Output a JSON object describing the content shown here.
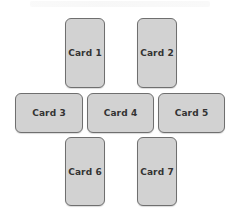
{
  "diagram": {
    "cards": [
      {
        "label": "Card 1",
        "x": 65,
        "y": 18,
        "w": 40,
        "h": 70
      },
      {
        "label": "Card 2",
        "x": 137,
        "y": 18,
        "w": 40,
        "h": 70
      },
      {
        "label": "Card 3",
        "x": 15,
        "y": 93,
        "w": 68,
        "h": 40
      },
      {
        "label": "Card 4",
        "x": 87,
        "y": 93,
        "w": 67,
        "h": 40
      },
      {
        "label": "Card 5",
        "x": 158,
        "y": 93,
        "w": 67,
        "h": 40
      },
      {
        "label": "Card 6",
        "x": 65,
        "y": 137,
        "w": 40,
        "h": 69
      },
      {
        "label": "Card 7",
        "x": 137,
        "y": 137,
        "w": 40,
        "h": 69
      }
    ],
    "colors": {
      "card_fill": "#d2d2d2",
      "card_border": "#6f6f6f",
      "text": "#333333",
      "background": "#ffffff"
    }
  }
}
